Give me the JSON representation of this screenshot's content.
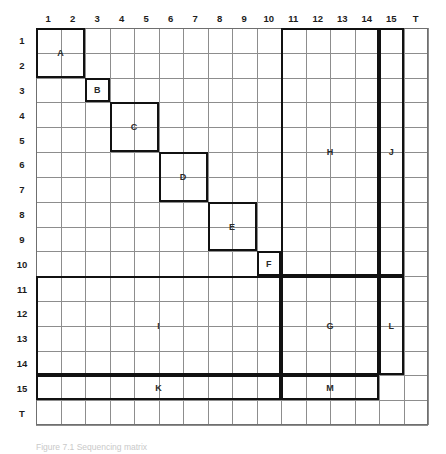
{
  "figure": {
    "title": "",
    "caption": "Figure 7.1  Sequencing matrix"
  },
  "axes": {
    "column_headers": [
      "1",
      "2",
      "3",
      "4",
      "5",
      "6",
      "7",
      "8",
      "9",
      "10",
      "11",
      "12",
      "13",
      "14",
      "15",
      "T"
    ],
    "row_headers": [
      "1",
      "2",
      "3",
      "4",
      "5",
      "6",
      "7",
      "8",
      "9",
      "10",
      "11",
      "12",
      "13",
      "14",
      "15",
      "T"
    ]
  },
  "chart_data": {
    "type": "heatmap",
    "title": "",
    "xlabel": "",
    "ylabel": "",
    "grid": true,
    "legend": "none",
    "n_cols": 16,
    "n_rows": 16,
    "categories": [
      "1",
      "2",
      "3",
      "4",
      "5",
      "6",
      "7",
      "8",
      "9",
      "10",
      "11",
      "12",
      "13",
      "14",
      "15",
      "T"
    ],
    "row_categories": [
      "1",
      "2",
      "3",
      "4",
      "5",
      "6",
      "7",
      "8",
      "9",
      "10",
      "11",
      "12",
      "13",
      "14",
      "15",
      "T"
    ],
    "blocks": [
      {
        "label": "A",
        "col_start": 1,
        "col_end": 2,
        "row_start": 1,
        "row_end": 2
      },
      {
        "label": "B",
        "col_start": 3,
        "col_end": 3,
        "row_start": 3,
        "row_end": 3
      },
      {
        "label": "C",
        "col_start": 4,
        "col_end": 5,
        "row_start": 4,
        "row_end": 5
      },
      {
        "label": "D",
        "col_start": 6,
        "col_end": 7,
        "row_start": 6,
        "row_end": 7
      },
      {
        "label": "E",
        "col_start": 8,
        "col_end": 9,
        "row_start": 8,
        "row_end": 9
      },
      {
        "label": "F",
        "col_start": 10,
        "col_end": 10,
        "row_start": 10,
        "row_end": 10
      },
      {
        "label": "H",
        "col_start": 11,
        "col_end": 14,
        "row_start": 1,
        "row_end": 10
      },
      {
        "label": "J",
        "col_start": 15,
        "col_end": 15,
        "row_start": 1,
        "row_end": 10
      },
      {
        "label": "I",
        "col_start": 1,
        "col_end": 10,
        "row_start": 11,
        "row_end": 14
      },
      {
        "label": "G",
        "col_start": 11,
        "col_end": 14,
        "row_start": 11,
        "row_end": 14
      },
      {
        "label": "L",
        "col_start": 15,
        "col_end": 15,
        "row_start": 11,
        "row_end": 14
      },
      {
        "label": "K",
        "col_start": 1,
        "col_end": 10,
        "row_start": 15,
        "row_end": 15
      },
      {
        "label": "M",
        "col_start": 11,
        "col_end": 14,
        "row_start": 15,
        "row_end": 15
      }
    ]
  },
  "colors": {
    "block_stroke": "#111111",
    "grid_line": "#8d8d8d",
    "text": "#1c1c1c",
    "background": "#ffffff"
  }
}
